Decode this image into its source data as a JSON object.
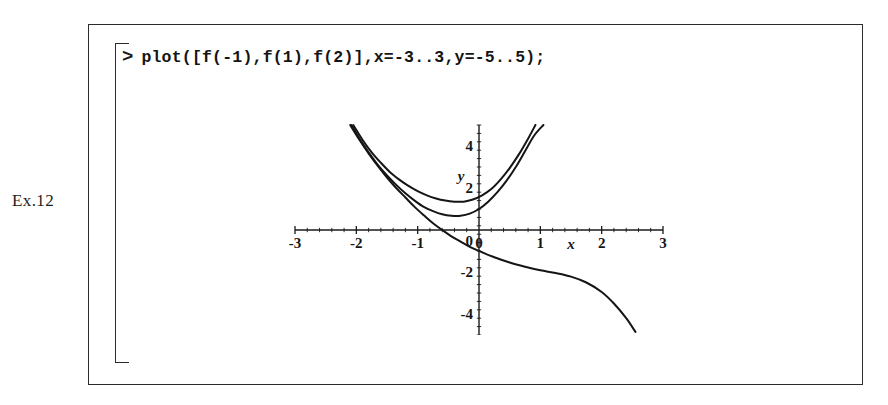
{
  "exercise": {
    "label": "Ex.12"
  },
  "worksheet": {
    "prompt_symbol": ">",
    "command": "plot([f(-1),f(1),f(2)],x=-3..3,y=-5..5);"
  },
  "chart_data": {
    "type": "line",
    "title": "",
    "xlabel": "x",
    "ylabel": "y",
    "xlim": [
      -3,
      3
    ],
    "ylim": [
      -5,
      5
    ],
    "grid": false,
    "legend": "none",
    "x_tick_labels": [
      "-3",
      "-2",
      "-1",
      "0",
      "1",
      "2",
      "3"
    ],
    "x_ticks": [
      -3,
      -2,
      -1,
      0,
      1,
      2,
      3
    ],
    "y_tick_labels": [
      "4",
      "2",
      "0",
      "-2",
      "-4"
    ],
    "y_ticks": [
      4,
      2,
      0,
      -2,
      -4
    ],
    "minor_ticks": true,
    "axis_position": "zero",
    "series": [
      {
        "name": "f(1)",
        "color": "#151515",
        "points": [
          [
            -2.05,
            5.0
          ],
          [
            -1.9,
            4.3
          ],
          [
            -1.75,
            3.7
          ],
          [
            -1.6,
            3.2
          ],
          [
            -1.45,
            2.75
          ],
          [
            -1.3,
            2.4
          ],
          [
            -1.15,
            2.1
          ],
          [
            -1.0,
            1.85
          ],
          [
            -0.85,
            1.65
          ],
          [
            -0.7,
            1.5
          ],
          [
            -0.55,
            1.4
          ],
          [
            -0.4,
            1.35
          ],
          [
            -0.25,
            1.35
          ],
          [
            -0.1,
            1.45
          ],
          [
            0.05,
            1.65
          ],
          [
            0.2,
            1.95
          ],
          [
            0.35,
            2.4
          ],
          [
            0.5,
            2.95
          ],
          [
            0.65,
            3.6
          ],
          [
            0.8,
            4.35
          ],
          [
            0.92,
            5.0
          ]
        ]
      },
      {
        "name": "f(2)",
        "color": "#151515",
        "points": [
          [
            -2.08,
            5.0
          ],
          [
            -1.95,
            4.35
          ],
          [
            -1.8,
            3.7
          ],
          [
            -1.65,
            3.1
          ],
          [
            -1.5,
            2.6
          ],
          [
            -1.35,
            2.15
          ],
          [
            -1.2,
            1.75
          ],
          [
            -1.05,
            1.4
          ],
          [
            -0.9,
            1.1
          ],
          [
            -0.75,
            0.9
          ],
          [
            -0.6,
            0.75
          ],
          [
            -0.45,
            0.68
          ],
          [
            -0.3,
            0.68
          ],
          [
            -0.15,
            0.78
          ],
          [
            0.0,
            1.0
          ],
          [
            0.15,
            1.35
          ],
          [
            0.3,
            1.8
          ],
          [
            0.45,
            2.35
          ],
          [
            0.6,
            3.0
          ],
          [
            0.75,
            3.75
          ],
          [
            0.9,
            4.5
          ],
          [
            1.05,
            5.0
          ]
        ]
      },
      {
        "name": "f(-1)",
        "color": "#151515",
        "points": [
          [
            -2.1,
            5.0
          ],
          [
            -1.95,
            4.3
          ],
          [
            -1.8,
            3.65
          ],
          [
            -1.65,
            3.05
          ],
          [
            -1.5,
            2.5
          ],
          [
            -1.35,
            2.0
          ],
          [
            -1.2,
            1.55
          ],
          [
            -1.05,
            1.1
          ],
          [
            -0.9,
            0.7
          ],
          [
            -0.75,
            0.32
          ],
          [
            -0.6,
            0.0
          ],
          [
            -0.45,
            -0.3
          ],
          [
            -0.3,
            -0.55
          ],
          [
            -0.15,
            -0.8
          ],
          [
            0.0,
            -1.0
          ],
          [
            0.25,
            -1.3
          ],
          [
            0.5,
            -1.55
          ],
          [
            0.75,
            -1.75
          ],
          [
            1.0,
            -1.92
          ],
          [
            1.25,
            -2.05
          ],
          [
            1.5,
            -2.22
          ],
          [
            1.75,
            -2.5
          ],
          [
            2.0,
            -2.95
          ],
          [
            2.2,
            -3.5
          ],
          [
            2.4,
            -4.2
          ],
          [
            2.55,
            -4.85
          ]
        ]
      }
    ]
  }
}
